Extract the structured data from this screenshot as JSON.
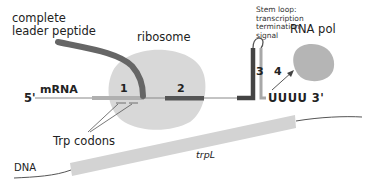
{
  "diagram": {
    "labels": {
      "leader_peptide": "complete\nleader peptide",
      "leader_line1": "complete",
      "leader_line2": "leader peptide",
      "ribosome": "ribosome",
      "stem_loop_line1": "Stem loop:",
      "stem_loop_line2": "transcription",
      "stem_loop_line3": "termination",
      "stem_loop_line4": "signal",
      "rna_pol": "RNA pol",
      "five_prime": "5'",
      "mrna": "mRNA",
      "region1": "1",
      "region2": "2",
      "region3": "3",
      "region4": "4",
      "three_prime_end": "UUUU 3'",
      "trp_codons": "Trp codons",
      "dna": "DNA",
      "gene": "trpL"
    },
    "colors": {
      "ribosome": "#d6d6d6",
      "peptide": "#666666",
      "mrna_line": "#888888",
      "region1": "#b0b0b0",
      "region2": "#555555",
      "region3": "#444444",
      "region4": "#a8a8a8",
      "rna_pol": "#b5b5b5",
      "dna_gene": "#d3d3d3",
      "dna_line": "#555555"
    }
  }
}
